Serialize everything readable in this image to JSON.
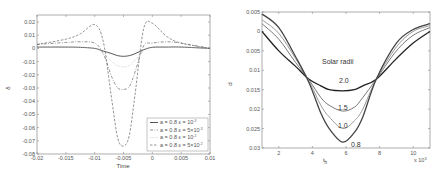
{
  "chart_data": [
    {
      "type": "line",
      "title": "",
      "xlabel": "Time",
      "ylabel": "δ",
      "xlim": [
        -0.02,
        0.01
      ],
      "ylim": [
        -0.08,
        0.025
      ],
      "xticks": [
        "-0.02",
        "-0.015",
        "-0.01",
        "-0.005",
        "0",
        "0.005",
        "0.01"
      ],
      "yticks": [
        "0.02",
        "0.01",
        "0",
        "-0.01",
        "-0.02",
        "-0.03",
        "-0.04",
        "-0.05",
        "-0.06",
        "-0.07",
        "-0.08"
      ],
      "grid": false,
      "legend_position": "lower right",
      "x": [
        -0.02,
        -0.015,
        -0.0125,
        -0.01,
        -0.0085,
        -0.007,
        -0.006,
        -0.005,
        -0.004,
        -0.003,
        -0.0015,
        0,
        0.0025,
        0.005,
        0.01
      ],
      "series": [
        {
          "name": "a = 0.8  ε = 10^-3",
          "style": "solid",
          "values": [
            0.001,
            0.001,
            0.0008,
            0.0,
            -0.002,
            -0.004,
            -0.0055,
            -0.006,
            -0.0055,
            -0.004,
            -0.001,
            0.0008,
            0.001,
            0.001,
            0.0
          ]
        },
        {
          "name": "a = 0.8  ε = 5×10^-3",
          "style": "dash-dot",
          "values": [
            0.003,
            0.0045,
            0.005,
            0.004,
            -0.004,
            -0.022,
            -0.03,
            -0.031,
            -0.029,
            -0.018,
            0.002,
            0.004,
            0.005,
            0.004,
            0.0
          ]
        },
        {
          "name": "a = 0.8  ε = 10^-2",
          "style": "dotted",
          "values": [
            0.001,
            0.001,
            0.0008,
            0.0,
            -0.004,
            -0.01,
            -0.013,
            -0.014,
            -0.013,
            -0.009,
            -0.002,
            0.001,
            0.001,
            0.001,
            0.0
          ]
        },
        {
          "name": "a = 0.8  ε = 5×10^-2",
          "style": "dashed",
          "values": [
            0.003,
            0.007,
            0.011,
            0.018,
            0.005,
            -0.04,
            -0.068,
            -0.074,
            -0.066,
            -0.035,
            0.015,
            0.019,
            0.009,
            0.004,
            0.0
          ]
        }
      ]
    },
    {
      "type": "line",
      "title": "",
      "xlabel": "t_h",
      "x_multiplier": "× 10³",
      "ylabel": "d",
      "xlim": [
        1,
        11
      ],
      "ylim": [
        -0.005,
        0.03
      ],
      "y_inverted": true,
      "xticks": [
        "2",
        "4",
        "6",
        "8",
        "10"
      ],
      "yticks": [
        "0.005",
        "0",
        "0.005",
        "0.01",
        "0.015",
        "0.02",
        "0.025",
        "0.03"
      ],
      "grid": false,
      "annotations": [
        "Solar radii",
        "2.0",
        "1.5",
        "1.0",
        "0.8"
      ],
      "x": [
        1,
        2,
        3,
        3.8,
        4.5,
        5,
        5.8,
        6.5,
        7,
        7.8,
        9,
        10,
        11
      ],
      "series": [
        {
          "name": "2.0",
          "values": [
            0.0,
            0.005,
            0.009,
            0.0123,
            0.014,
            0.015,
            0.0153,
            0.015,
            0.014,
            0.0123,
            0.007,
            0.003,
            0.0
          ]
        },
        {
          "name": "1.5",
          "values": [
            -0.002,
            0.002,
            0.008,
            0.0125,
            0.017,
            0.019,
            0.0205,
            0.0195,
            0.017,
            0.0123,
            0.005,
            0.001,
            -0.001
          ]
        },
        {
          "name": "1.0",
          "values": [
            -0.003,
            0.0005,
            0.007,
            0.0128,
            0.019,
            0.022,
            0.025,
            0.023,
            0.02,
            0.0123,
            0.004,
            0.0,
            -0.0015
          ]
        },
        {
          "name": "0.8",
          "values": [
            -0.0045,
            -0.001,
            0.0065,
            0.0132,
            0.021,
            0.025,
            0.0285,
            0.026,
            0.022,
            0.0123,
            0.003,
            -0.0005,
            -0.002
          ]
        }
      ]
    }
  ],
  "left_chart": {
    "xlabel": "Time",
    "ylabel": "δ",
    "legend": [
      "a = 0.8  ε = 10",
      "a = 0.8  ε = 5×10",
      "a = 0.8  ε = 10",
      "a = 0.8  ε = 5×10"
    ],
    "legend_exp": [
      "-3",
      "-3",
      "-2",
      "-2"
    ]
  },
  "right_chart": {
    "xlabel": "t",
    "xlabel_sub": "h",
    "ylabel": "d",
    "multiplier": "x 10",
    "multiplier_exp": "3",
    "annotation_title": "Solar radii",
    "curve_labels": [
      "2.0",
      "1.5",
      "1.0",
      "0.8"
    ]
  }
}
